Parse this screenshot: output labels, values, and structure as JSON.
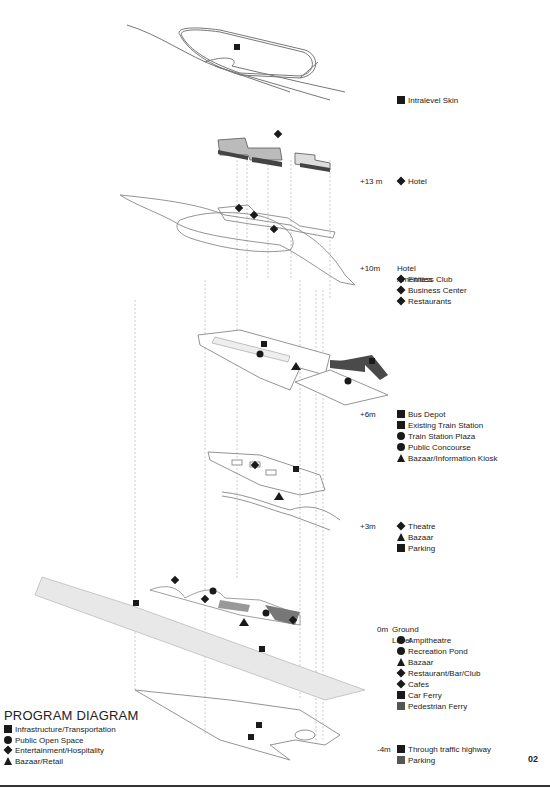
{
  "figure": {
    "title": "PROGRAM DIAGRAM",
    "page_number": "02"
  },
  "program_key": [
    {
      "symbol": "square",
      "label": "Infrastructure/Transportation"
    },
    {
      "symbol": "circle",
      "label": "Public Open Space"
    },
    {
      "symbol": "diamond",
      "label": "Entertainment/Hospitality"
    },
    {
      "symbol": "triangle",
      "label": "Bazaar/Retail"
    }
  ],
  "levels": [
    {
      "elevation": "",
      "title": "",
      "items": [
        {
          "num": "1",
          "symbol": "square",
          "label": "Intralevel Skin"
        }
      ]
    },
    {
      "elevation": "+13 m",
      "title": "",
      "items": [
        {
          "num": "2",
          "symbol": "diamond",
          "label": "Hotel"
        }
      ]
    },
    {
      "elevation": "+10m",
      "title": "Hotel Amenities",
      "items": [
        {
          "num": "3",
          "symbol": "diamond",
          "label": "Fitness Club"
        },
        {
          "num": "4",
          "symbol": "diamond",
          "label": "Business Center"
        },
        {
          "num": "5",
          "symbol": "diamond",
          "label": "Restaurants"
        }
      ]
    },
    {
      "elevation": "+6m",
      "title": "",
      "items": [
        {
          "num": "6",
          "symbol": "square",
          "label": "Bus Depot"
        },
        {
          "num": "7",
          "symbol": "square",
          "label": "Existing Train Station"
        },
        {
          "num": "8",
          "symbol": "circle",
          "label": "Train Station Plaza"
        },
        {
          "num": "9",
          "symbol": "circle",
          "label": "Public Concourse"
        },
        {
          "num": "",
          "symbol": "triangle",
          "label": "Bazaar/Information Kiosk"
        }
      ]
    },
    {
      "elevation": "+3m",
      "title": "",
      "items": [
        {
          "num": "11",
          "symbol": "diamond",
          "label": "Theatre"
        },
        {
          "num": "",
          "symbol": "triangle",
          "label": "Bazaar"
        },
        {
          "num": "13",
          "symbol": "square",
          "label": "Parking"
        }
      ]
    },
    {
      "elevation": "0m",
      "title": "Ground Level",
      "items": [
        {
          "num": "14",
          "symbol": "circle",
          "label": "Ampitheatre"
        },
        {
          "num": "15",
          "symbol": "circle",
          "label": "Recreation Pond"
        },
        {
          "num": "",
          "symbol": "triangle",
          "label": "Bazaar"
        },
        {
          "num": "17",
          "symbol": "diamond",
          "label": "Restaurant/Bar/Club"
        },
        {
          "num": "18",
          "symbol": "diamond",
          "label": "Cafes"
        },
        {
          "num": "19",
          "symbol": "square",
          "label": "Car Ferry"
        },
        {
          "num": "20",
          "symbol": "square",
          "label": "Pedestrian Ferry"
        }
      ]
    },
    {
      "elevation": "-4m",
      "title": "",
      "items": [
        {
          "num": "21",
          "symbol": "square",
          "label": "Through traffic highway"
        },
        {
          "num": "22",
          "symbol": "square",
          "label": "Parking"
        }
      ]
    }
  ],
  "colors": {
    "ink": "#1a1a1a",
    "linework": "#6a6a6a",
    "water_plane": "#e8e8e8",
    "train_station": "#4a4a4a",
    "rule": "#333333"
  }
}
